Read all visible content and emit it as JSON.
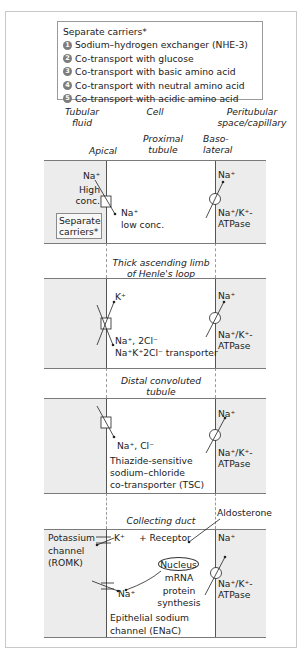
{
  "legend": {
    "title": "Separate carriers*",
    "items": [
      {
        "num": "1",
        "label": "Sodium–hydrogen exchanger (NHE-3)"
      },
      {
        "num": "2",
        "label": "Co-transport with glucose"
      },
      {
        "num": "3",
        "label": "Co-transport with basic amino acid"
      },
      {
        "num": "4",
        "label": "Co-transport with neutral amino acid"
      },
      {
        "num": "5",
        "label": "Co-transport with acidic amino acid"
      }
    ]
  },
  "headers": {
    "tubular_fluid": [
      "Tubular",
      "fluid"
    ],
    "cell": "Cell",
    "peritubular": [
      "Peritubular",
      "space/capillary"
    ],
    "apical": "Apical",
    "basolateral": [
      "Baso-",
      "lateral"
    ]
  },
  "segments": {
    "proximal": {
      "title": [
        "Proximal",
        "tubule"
      ],
      "na_fluid": "Na⁺",
      "high_conc": [
        "High",
        "conc."
      ],
      "separate_carriers": [
        "Separate",
        "carriers*"
      ],
      "na_cell": "Na⁺",
      "low_conc": "low conc.",
      "na_baso": "Na⁺",
      "atpase": [
        "Na⁺/K⁺-",
        "ATPase"
      ]
    },
    "henle": {
      "title": [
        "Thick ascending limb",
        "of Henle's loop"
      ],
      "k": "K⁺",
      "na_2cl": "Na⁺, 2Cl⁻",
      "transporter": "Na⁺K⁺2Cl⁻ transporter",
      "na_baso": "Na⁺",
      "atpase": [
        "Na⁺/K⁺-",
        "ATPase"
      ]
    },
    "distal": {
      "title": [
        "Distal convoluted",
        "tubule"
      ],
      "na_cl": "Na⁺, Cl⁻",
      "tsc": [
        "Thiazide-sensitive",
        "sodium–chloride",
        "co-transporter (TSC)"
      ],
      "na_baso": "Na⁺",
      "atpase": [
        "Na⁺/K⁺-",
        "ATPase"
      ]
    },
    "collecting": {
      "title": "Collecting duct",
      "aldosterone": "Aldosterone",
      "potassium_channel": [
        "Potassium",
        "channel",
        "(ROMK)"
      ],
      "k": "K⁺",
      "receptor": "+ Receptor",
      "nucleus": "Nucleus",
      "mrna": [
        "mRNA",
        "protein",
        "synthesis"
      ],
      "na_cell": "Na⁺",
      "enac": [
        "Epithelial sodium",
        "channel (ENaC)"
      ],
      "na_baso": "Na⁺",
      "atpase": [
        "Na⁺/K⁺-",
        "ATPase"
      ]
    }
  },
  "colors": {
    "band_fill": "#ececec",
    "cell_fill": "#ffffff",
    "line": "#555555",
    "legend_bullet": "#7d7d7d"
  }
}
